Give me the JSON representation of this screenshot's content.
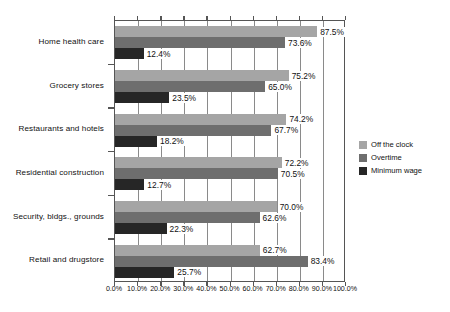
{
  "chart_data": {
    "type": "bar",
    "orientation": "horizontal",
    "title": "",
    "subtitle": "",
    "xlabel": "",
    "ylabel": "",
    "xlim": [
      0,
      100
    ],
    "xticks": [
      0,
      10,
      20,
      30,
      40,
      50,
      60,
      70,
      80,
      90,
      100
    ],
    "xtick_labels": [
      "0.0%",
      "10.0%",
      "20.0%",
      "30.0%",
      "40.0%",
      "50.0%",
      "60.0%",
      "70.0%",
      "80.0%",
      "90.0%",
      "100.0%"
    ],
    "grid": true,
    "grid_axis": "x",
    "legend_position": "right",
    "categories": [
      "Home health care",
      "Grocery stores",
      "Restaurants and hotels",
      "Residential construction",
      "Security, bldgs., grounds",
      "Retail and drugstore"
    ],
    "series": [
      {
        "name": "Off the clock",
        "color": "#a5a5a5",
        "values": [
          87.5,
          75.2,
          74.2,
          72.2,
          70.0,
          62.7
        ],
        "labels": [
          "87.5%",
          "75.2%",
          "74.2%",
          "72.2%",
          "70.0%",
          "62.7%"
        ]
      },
      {
        "name": "Overtime",
        "color": "#6e6e6e",
        "values": [
          73.6,
          65.0,
          67.7,
          70.5,
          62.6,
          83.4
        ],
        "labels": [
          "73.6%",
          "65.0%",
          "67.7%",
          "70.5%",
          "62.6%",
          "83.4%"
        ]
      },
      {
        "name": "Minimum wage",
        "color": "#262626",
        "values": [
          12.4,
          23.5,
          18.2,
          12.7,
          22.3,
          25.7
        ],
        "labels": [
          "12.4%",
          "23.5%",
          "18.2%",
          "12.7%",
          "22.3%",
          "25.7%"
        ]
      }
    ]
  },
  "legend": {
    "items": [
      {
        "label": "Off the clock",
        "color": "#a5a5a5"
      },
      {
        "label": "Overtime",
        "color": "#6e6e6e"
      },
      {
        "label": "Minimum wage",
        "color": "#262626"
      }
    ]
  }
}
